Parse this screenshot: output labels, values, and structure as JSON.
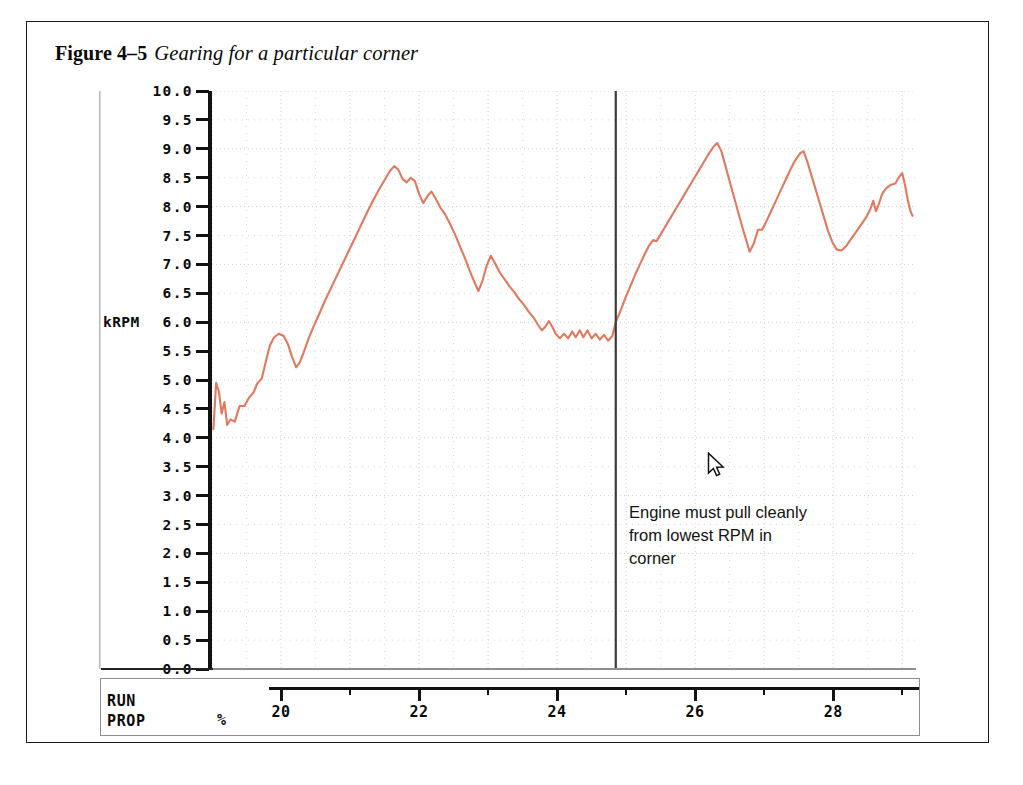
{
  "caption": {
    "figure_number": "Figure 4–5",
    "title": "Gearing for a particular corner"
  },
  "annotation": {
    "line1": "Engine must pull cleanly",
    "line2": "from lowest RPM in",
    "line3": "corner"
  },
  "axes": {
    "y": {
      "unit_label": "kRPM",
      "tick_labels": [
        "10.0",
        "9.5",
        "9.0",
        "8.5",
        "8.0",
        "7.5",
        "7.0",
        "6.5",
        "6.0",
        "5.5",
        "5.0",
        "4.5",
        "4.0",
        "3.5",
        "3.0",
        "2.5",
        "2.0",
        "1.5",
        "1.0",
        "0.5",
        "0.0"
      ],
      "min": 0.0,
      "max": 10.0,
      "step": 0.5
    },
    "x": {
      "name_line1": "RUN",
      "name_line2": "PROP",
      "unit_label": "%",
      "major_ticks": [
        20,
        22,
        24,
        26,
        28
      ],
      "minor_ticks": [
        21,
        23,
        25,
        27,
        29
      ],
      "min": 19.0,
      "max": 29.2
    }
  },
  "cursor": {
    "x_value": 24.85,
    "y_value": 6.0
  },
  "colors": {
    "trace": "#e0795f",
    "axis": "#121212",
    "grid": "#cfcfcf",
    "cursor_line": "#3a3a3a",
    "page_border": "#1a1a1a"
  },
  "chart_data": {
    "type": "line",
    "title": "Gearing for a particular corner",
    "xlabel": "RUN PROP %",
    "ylabel": "kRPM",
    "xlim": [
      19.0,
      29.2
    ],
    "ylim": [
      0.0,
      10.0
    ],
    "grid": true,
    "legend": null,
    "series": [
      {
        "name": "Engine speed",
        "color": "#e0795f",
        "points": [
          [
            19.02,
            4.15
          ],
          [
            19.06,
            4.95
          ],
          [
            19.1,
            4.8
          ],
          [
            19.14,
            4.42
          ],
          [
            19.18,
            4.62
          ],
          [
            19.22,
            4.22
          ],
          [
            19.27,
            4.32
          ],
          [
            19.33,
            4.28
          ],
          [
            19.4,
            4.55
          ],
          [
            19.47,
            4.55
          ],
          [
            19.54,
            4.7
          ],
          [
            19.6,
            4.78
          ],
          [
            19.66,
            4.95
          ],
          [
            19.72,
            5.02
          ],
          [
            19.78,
            5.32
          ],
          [
            19.84,
            5.6
          ],
          [
            19.9,
            5.74
          ],
          [
            19.97,
            5.8
          ],
          [
            20.04,
            5.76
          ],
          [
            20.1,
            5.62
          ],
          [
            20.16,
            5.4
          ],
          [
            20.22,
            5.22
          ],
          [
            20.27,
            5.3
          ],
          [
            20.33,
            5.48
          ],
          [
            20.4,
            5.72
          ],
          [
            20.48,
            5.95
          ],
          [
            20.56,
            6.16
          ],
          [
            20.64,
            6.38
          ],
          [
            20.72,
            6.58
          ],
          [
            20.8,
            6.78
          ],
          [
            20.88,
            6.98
          ],
          [
            20.96,
            7.18
          ],
          [
            21.04,
            7.38
          ],
          [
            21.12,
            7.58
          ],
          [
            21.2,
            7.78
          ],
          [
            21.28,
            7.98
          ],
          [
            21.36,
            8.16
          ],
          [
            21.44,
            8.34
          ],
          [
            21.52,
            8.5
          ],
          [
            21.58,
            8.62
          ],
          [
            21.64,
            8.7
          ],
          [
            21.7,
            8.64
          ],
          [
            21.76,
            8.48
          ],
          [
            21.82,
            8.42
          ],
          [
            21.88,
            8.5
          ],
          [
            21.94,
            8.44
          ],
          [
            22.0,
            8.22
          ],
          [
            22.06,
            8.06
          ],
          [
            22.12,
            8.18
          ],
          [
            22.18,
            8.26
          ],
          [
            22.24,
            8.14
          ],
          [
            22.31,
            7.98
          ],
          [
            22.38,
            7.86
          ],
          [
            22.45,
            7.7
          ],
          [
            22.52,
            7.52
          ],
          [
            22.59,
            7.32
          ],
          [
            22.66,
            7.12
          ],
          [
            22.73,
            6.9
          ],
          [
            22.8,
            6.7
          ],
          [
            22.86,
            6.54
          ],
          [
            22.92,
            6.72
          ],
          [
            22.98,
            6.98
          ],
          [
            23.04,
            7.15
          ],
          [
            23.1,
            7.02
          ],
          [
            23.17,
            6.86
          ],
          [
            23.24,
            6.74
          ],
          [
            23.31,
            6.62
          ],
          [
            23.38,
            6.52
          ],
          [
            23.45,
            6.4
          ],
          [
            23.52,
            6.3
          ],
          [
            23.59,
            6.18
          ],
          [
            23.66,
            6.08
          ],
          [
            23.72,
            5.96
          ],
          [
            23.78,
            5.86
          ],
          [
            23.83,
            5.92
          ],
          [
            23.88,
            6.02
          ],
          [
            23.93,
            5.92
          ],
          [
            23.98,
            5.8
          ],
          [
            24.04,
            5.72
          ],
          [
            24.1,
            5.8
          ],
          [
            24.16,
            5.72
          ],
          [
            24.22,
            5.84
          ],
          [
            24.27,
            5.74
          ],
          [
            24.33,
            5.86
          ],
          [
            24.38,
            5.74
          ],
          [
            24.44,
            5.86
          ],
          [
            24.5,
            5.72
          ],
          [
            24.56,
            5.8
          ],
          [
            24.62,
            5.7
          ],
          [
            24.68,
            5.78
          ],
          [
            24.74,
            5.68
          ],
          [
            24.8,
            5.76
          ],
          [
            24.85,
            6.0
          ],
          [
            24.92,
            6.2
          ],
          [
            24.99,
            6.42
          ],
          [
            25.06,
            6.62
          ],
          [
            25.13,
            6.82
          ],
          [
            25.2,
            7.0
          ],
          [
            25.27,
            7.18
          ],
          [
            25.33,
            7.32
          ],
          [
            25.39,
            7.42
          ],
          [
            25.44,
            7.4
          ],
          [
            25.5,
            7.52
          ],
          [
            25.57,
            7.66
          ],
          [
            25.64,
            7.8
          ],
          [
            25.71,
            7.94
          ],
          [
            25.78,
            8.08
          ],
          [
            25.85,
            8.22
          ],
          [
            25.92,
            8.36
          ],
          [
            25.99,
            8.5
          ],
          [
            26.06,
            8.64
          ],
          [
            26.13,
            8.78
          ],
          [
            26.2,
            8.92
          ],
          [
            26.27,
            9.04
          ],
          [
            26.32,
            9.1
          ],
          [
            26.38,
            8.96
          ],
          [
            26.44,
            8.7
          ],
          [
            26.5,
            8.44
          ],
          [
            26.56,
            8.18
          ],
          [
            26.62,
            7.92
          ],
          [
            26.68,
            7.66
          ],
          [
            26.74,
            7.42
          ],
          [
            26.79,
            7.22
          ],
          [
            26.85,
            7.36
          ],
          [
            26.91,
            7.6
          ],
          [
            26.97,
            7.6
          ],
          [
            27.03,
            7.74
          ],
          [
            27.1,
            7.92
          ],
          [
            27.17,
            8.1
          ],
          [
            27.24,
            8.28
          ],
          [
            27.31,
            8.46
          ],
          [
            27.38,
            8.64
          ],
          [
            27.45,
            8.8
          ],
          [
            27.52,
            8.92
          ],
          [
            27.57,
            8.96
          ],
          [
            27.63,
            8.76
          ],
          [
            27.69,
            8.52
          ],
          [
            27.75,
            8.28
          ],
          [
            27.81,
            8.04
          ],
          [
            27.87,
            7.8
          ],
          [
            27.93,
            7.56
          ],
          [
            27.99,
            7.38
          ],
          [
            28.05,
            7.26
          ],
          [
            28.12,
            7.24
          ],
          [
            28.19,
            7.32
          ],
          [
            28.26,
            7.44
          ],
          [
            28.33,
            7.56
          ],
          [
            28.4,
            7.68
          ],
          [
            28.47,
            7.8
          ],
          [
            28.54,
            7.96
          ],
          [
            28.58,
            8.1
          ],
          [
            28.62,
            7.92
          ],
          [
            28.66,
            8.04
          ],
          [
            28.71,
            8.22
          ],
          [
            28.77,
            8.32
          ],
          [
            28.84,
            8.38
          ],
          [
            28.9,
            8.4
          ],
          [
            28.96,
            8.52
          ],
          [
            29.0,
            8.58
          ],
          [
            29.04,
            8.38
          ],
          [
            29.08,
            8.12
          ],
          [
            29.12,
            7.92
          ],
          [
            29.15,
            7.84
          ]
        ]
      }
    ]
  }
}
